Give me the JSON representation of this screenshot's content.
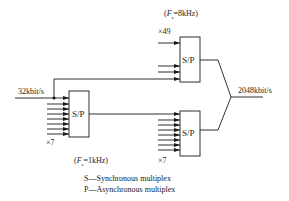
{
  "diagram": {
    "type": "multiplexing hierarchy",
    "input_rate": "32kbit/s",
    "output_rate": "2048kbit/s",
    "blocks": [
      {
        "id": "left",
        "label": "S/P",
        "multiplier": "×7",
        "frame_freq": "(Fs=1kHz)",
        "frame_freq_var": "F",
        "frame_freq_sub": "s",
        "frame_freq_rest": "=1kHz)"
      },
      {
        "id": "top",
        "label": "S/P",
        "multiplier": "×49",
        "frame_freq": "(Fs=8kHz)",
        "frame_freq_var": "F",
        "frame_freq_sub": "s",
        "frame_freq_rest": "=8kHz)"
      },
      {
        "id": "right",
        "label": "S/P",
        "multiplier": "×7"
      }
    ],
    "legend": [
      "S—Synchronous multiplex",
      "P—Asynchronous multiplex"
    ]
  }
}
